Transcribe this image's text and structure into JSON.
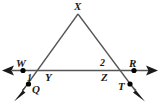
{
  "figure": {
    "type": "geometry-diagram",
    "canvas": {
      "width": 160,
      "height": 112,
      "background": "#ffffff"
    },
    "stroke_color": "#4d4d4d",
    "label_color": "#1a1a1a",
    "point_color": "#000000",
    "labels": {
      "apex": "X",
      "left_ray_end": "W",
      "right_ray_end": "R",
      "left_vertex": "Y",
      "right_vertex": "Z",
      "lower_left_point": "Q",
      "lower_right_point": "T",
      "angle_one": "1",
      "angle_two": "2"
    },
    "points": [
      {
        "name": "X",
        "x": 78,
        "y": 14,
        "dot": false
      },
      {
        "name": "W",
        "x": 23,
        "y": 70,
        "dot": true
      },
      {
        "name": "R",
        "x": 134,
        "y": 70,
        "dot": true
      },
      {
        "name": "Y",
        "x": 41,
        "y": 71,
        "dot": false
      },
      {
        "name": "Z",
        "x": 112,
        "y": 70,
        "dot": false
      },
      {
        "name": "Q",
        "x": 28,
        "y": 84,
        "dot": true
      },
      {
        "name": "T",
        "x": 130,
        "y": 84,
        "dot": true
      }
    ],
    "segments": [
      {
        "name": "line-WR",
        "from": "W-arrow",
        "to": "R-arrow",
        "arrows": "both"
      },
      {
        "name": "segment-XY",
        "from": "X",
        "to": "Y",
        "arrows": "none"
      },
      {
        "name": "segment-XZ",
        "from": "X",
        "to": "Z",
        "arrows": "none"
      },
      {
        "name": "ray-YQ",
        "from": "Y",
        "to": "Q-arrow",
        "arrows": "end"
      },
      {
        "name": "ray-ZT",
        "from": "Z",
        "to": "T-arrow",
        "arrows": "end"
      }
    ],
    "angles": [
      {
        "label": "1",
        "vertex": "Y",
        "position": "below-left"
      },
      {
        "label": "2",
        "vertex": "Z",
        "position": "above-left"
      }
    ]
  }
}
